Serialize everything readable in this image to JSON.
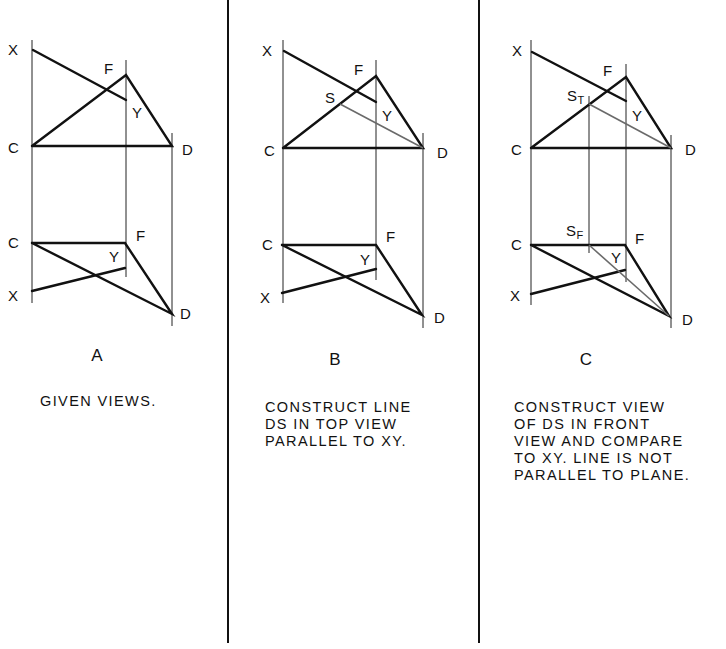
{
  "panels": [
    {
      "id": "A",
      "letter": "A",
      "caption": "GIVEN VIEWS.",
      "top_view_labels": {
        "x": "X",
        "f": "F",
        "y": "Y",
        "c": "C",
        "d": "D"
      },
      "front_view_labels": {
        "c": "C",
        "f": "F",
        "y": "Y",
        "x": "X",
        "d": "D"
      }
    },
    {
      "id": "B",
      "letter": "B",
      "caption": "CONSTRUCT LINE\nDS IN TOP VIEW\nPARALLEL TO XY.",
      "top_view_labels": {
        "x": "X",
        "f": "F",
        "s": "S",
        "y": "Y",
        "c": "C",
        "d": "D"
      },
      "front_view_labels": {
        "c": "C",
        "f": "F",
        "y": "Y",
        "x": "X",
        "d": "D"
      }
    },
    {
      "id": "C",
      "letter": "C",
      "caption": "CONSTRUCT VIEW\nOF DS IN FRONT\nVIEW AND COMPARE\nTO XY. LINE IS NOT\nPARALLEL TO PLANE.",
      "top_view_labels": {
        "x": "X",
        "f": "F",
        "s": "S",
        "s_sub": "T",
        "y": "Y",
        "c": "C",
        "d": "D"
      },
      "front_view_labels": {
        "s": "S",
        "s_sub": "F",
        "c": "C",
        "f": "F",
        "y": "Y",
        "x": "X",
        "d": "D"
      }
    }
  ],
  "colors": {
    "ink": "#111111",
    "construction_line": "#6a6a6a",
    "background": "#ffffff"
  }
}
